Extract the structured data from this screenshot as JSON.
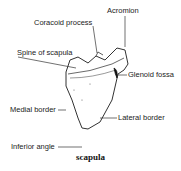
{
  "diagram": {
    "title": "scapula",
    "labels": {
      "acromion": "Acromion",
      "coracoid_process": "Coracoid process",
      "spine_of_scapula": "Spine of scapula",
      "glenoid_fossa": "Glenoid fossa",
      "medial_border": "Medial border",
      "lateral_border": "Lateral border",
      "inferior_angle": "Inferior angle"
    }
  }
}
